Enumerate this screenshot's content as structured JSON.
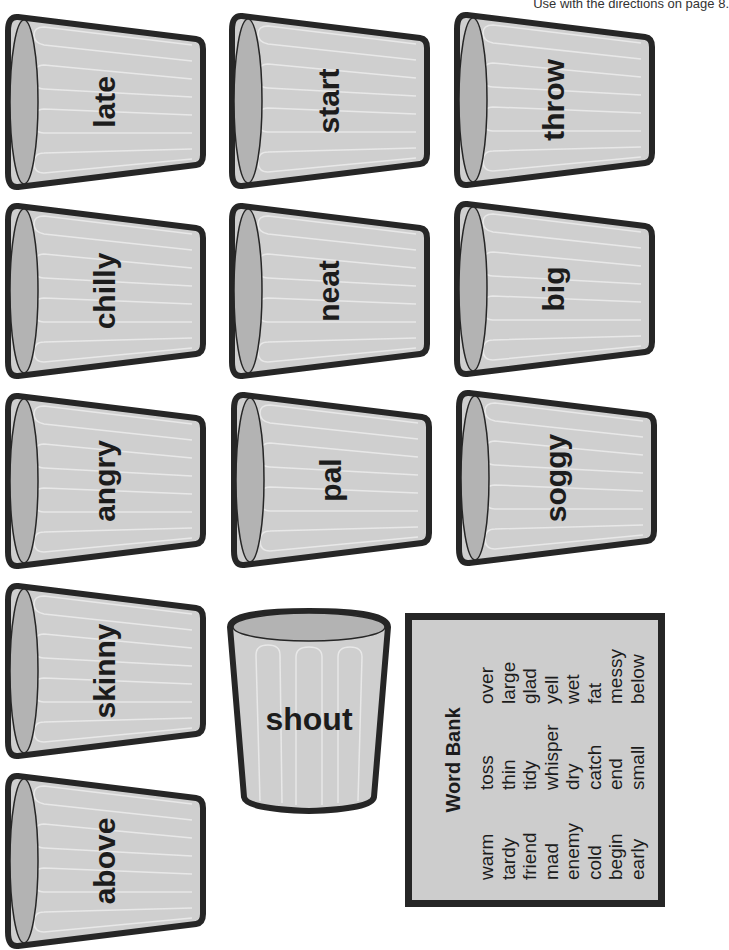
{
  "header": {
    "note": "Use with the directions on page 8."
  },
  "colors": {
    "cup_body": "#cfcfcf",
    "cup_mouth": "#b3b3b3",
    "cup_outline": "#262626",
    "cup_stripe": "#e8e8e8",
    "word_bank_bg": "#cdcdcd"
  },
  "cups": [
    {
      "word": "late"
    },
    {
      "word": "start"
    },
    {
      "word": "throw"
    },
    {
      "word": "chilly"
    },
    {
      "word": "neat"
    },
    {
      "word": "big"
    },
    {
      "word": "angry"
    },
    {
      "word": "pal"
    },
    {
      "word": "soggy"
    },
    {
      "word": "skinny"
    },
    {
      "word": "above"
    }
  ],
  "sample_cup": {
    "word": "shout"
  },
  "word_bank": {
    "title": "Word Bank",
    "columns": [
      [
        "warm",
        "tardy",
        "friend",
        "mad",
        "enemy",
        "cold",
        "begin",
        "early"
      ],
      [
        "toss",
        "thin",
        "tidy",
        "whisper",
        "dry",
        "catch",
        "end",
        "small"
      ],
      [
        "over",
        "large",
        "glad",
        "yell",
        "wet",
        "fat",
        "messy",
        "below"
      ]
    ]
  }
}
